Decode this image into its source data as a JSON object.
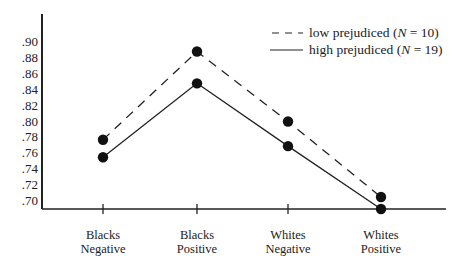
{
  "chart_data": {
    "type": "line",
    "title": "",
    "xlabel": "",
    "ylabel": "",
    "categories": [
      "Blacks Negative",
      "Blacks Positive",
      "Whites Negative",
      "Whites Positive"
    ],
    "category_lines": [
      [
        "Blacks",
        "Negative"
      ],
      [
        "Blacks",
        "Positive"
      ],
      [
        "Whites",
        "Negative"
      ],
      [
        "Whites",
        "Positive"
      ]
    ],
    "yticks": [
      ".90",
      ".88",
      ".86",
      ".84",
      ".82",
      ".80",
      ".78",
      ".76",
      ".74",
      ".72",
      ".70"
    ],
    "ylim": [
      0.69,
      0.915
    ],
    "grid": false,
    "legend_position": "top-right",
    "series": [
      {
        "name": "low prejudiced (N = 10)",
        "label_prefix": "low prejudiced (",
        "n_label": "N",
        "n_value": " = 10)",
        "style": "dashed",
        "values": [
          0.777,
          0.888,
          0.8,
          0.705
        ]
      },
      {
        "name": "high prejudiced (N = 19)",
        "label_prefix": "high prejudiced (",
        "n_label": "N",
        "n_value": " = 19)",
        "style": "solid",
        "values": [
          0.755,
          0.848,
          0.769,
          0.69
        ]
      }
    ]
  },
  "colors": {
    "ink": "#222222",
    "background": "#ffffff"
  }
}
